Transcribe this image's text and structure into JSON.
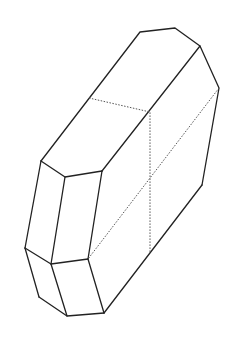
{
  "diagram": {
    "title": "",
    "style": {
      "edge_color": "#222222",
      "hidden_edge_color": "#555555",
      "background": "#ffffff"
    },
    "visible_edge_count": 22,
    "hidden_edge_count": 3
  }
}
